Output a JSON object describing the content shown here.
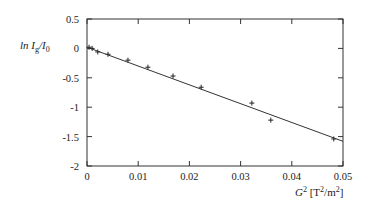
{
  "chart_data": {
    "type": "scatter",
    "title": "",
    "xlabel": "G2 [T2/m2]",
    "ylabel": "ln Ig/I0",
    "xlim": [
      0,
      0.05
    ],
    "ylim": [
      -2,
      0.5
    ],
    "grid": false,
    "legend": null,
    "x_ticks": [
      "0",
      "0.01",
      "0.02",
      "0.03",
      "0.04",
      "0.05"
    ],
    "y_ticks": [
      "0.5",
      "0",
      "-0.5",
      "-1",
      "-1.5",
      "-2"
    ],
    "series": [
      {
        "name": "measured",
        "marker": "plus",
        "x": [
          0.0004,
          0.001,
          0.0021,
          0.0041,
          0.008,
          0.0119,
          0.0168,
          0.0223,
          0.0322,
          0.0359,
          0.0482
        ],
        "y": [
          0.02,
          0.0,
          -0.06,
          -0.1,
          -0.2,
          -0.32,
          -0.47,
          -0.66,
          -0.93,
          -1.22,
          -1.54
        ]
      },
      {
        "name": "linear fit",
        "type": "line",
        "x": [
          0,
          0.05
        ],
        "y": [
          0.02,
          -1.58
        ]
      }
    ]
  },
  "labels": {
    "y_axis_main": "ln I",
    "y_axis_sub1": "g",
    "y_axis_mid": "/I",
    "y_axis_sub2": "0",
    "x_axis_main": "G",
    "x_axis_sup": "2",
    "x_axis_rest1": " [T",
    "x_axis_sup2": "2",
    "x_axis_rest2": "/m",
    "x_axis_sup3": "2",
    "x_axis_rest3": "]"
  }
}
